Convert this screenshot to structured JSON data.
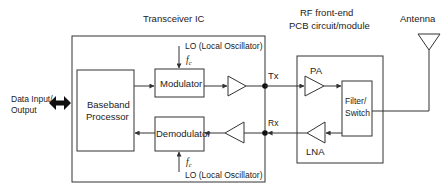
{
  "diagram": {
    "title_transceiver": "Transceiver IC",
    "title_rf_line1": "RF front-end",
    "title_rf_line2": "PCB circuit/module",
    "antenna_label": "Antenna",
    "data_io_line1": "Data Input/",
    "data_io_line2": "Output",
    "baseband_line1": "Baseband",
    "baseband_line2": "Processor",
    "modulator": "Modulator",
    "demodulator": "Demodulator",
    "lo_top": "LO (Local Oscillator)",
    "lo_bottom": "LO (Local Oscillator)",
    "fc_symbol": "f",
    "fc_subscript": "c",
    "tx_label": "Tx",
    "rx_label": "Rx",
    "pa_label": "PA",
    "lna_label": "LNA",
    "filter_line1": "Filter/",
    "filter_line2": "Switch",
    "colors": {
      "stroke": "#333333",
      "text": "#222222",
      "background": "#ffffff"
    }
  }
}
